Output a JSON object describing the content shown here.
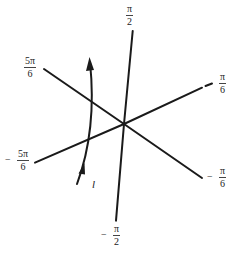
{
  "diagram": {
    "colors": {
      "line": "#1a1a1a",
      "text": "#222222",
      "background": "#ffffff"
    },
    "center": {
      "x": 124,
      "y": 124
    },
    "rays": [
      {
        "id": "pi-over-2",
        "angle": "π/2",
        "end": {
          "x": 132.7,
          "y": 31
        }
      },
      {
        "id": "pi-over-6",
        "angle": "π/6",
        "end": {
          "x": 202,
          "y": 87.7
        },
        "dash_end": {
          "x": 212,
          "y": 84
        }
      },
      {
        "id": "5pi-over-6",
        "angle": "5π/6",
        "end": {
          "x": 44,
          "y": 69
        }
      },
      {
        "id": "minus-5pi-over-6",
        "angle": "-5π/6",
        "end": {
          "x": 35,
          "y": 162.7
        }
      },
      {
        "id": "minus-pi-over-6",
        "angle": "-π/6",
        "end": {
          "x": 202,
          "y": 178
        }
      },
      {
        "id": "minus-pi-over-2",
        "angle": "-π/2",
        "end": {
          "x": 116,
          "y": 220.7
        }
      }
    ],
    "labels": {
      "pi_over_2": {
        "sign": "",
        "num": "π",
        "den": "2"
      },
      "pi_over_6": {
        "sign": "",
        "num": "π",
        "den": "6"
      },
      "five_pi_over_6": {
        "sign": "",
        "num": "5π",
        "den": "6"
      },
      "minus_five_pi_over_6": {
        "sign": "−",
        "num": "5π",
        "den": "6"
      },
      "minus_pi_over_6": {
        "sign": "−",
        "num": "π",
        "den": "6"
      },
      "minus_pi_over_2": {
        "sign": "−",
        "num": "π",
        "den": "2"
      }
    },
    "curve": {
      "label": "l",
      "start": {
        "x": 77,
        "y": 184
      },
      "end": {
        "x": 90,
        "y": 57
      }
    }
  }
}
